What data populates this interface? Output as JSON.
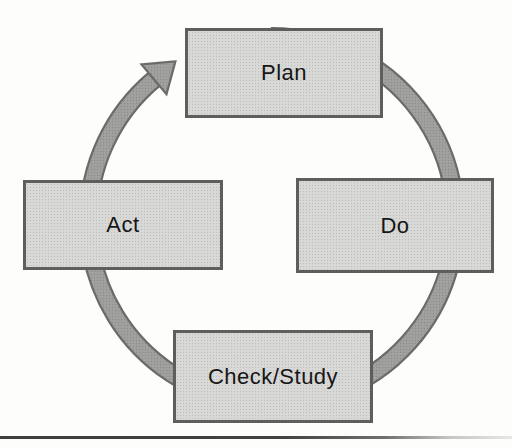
{
  "diagram": {
    "type": "cycle",
    "direction": "clockwise",
    "nodes": [
      {
        "id": "plan",
        "label": "Plan",
        "position": "top"
      },
      {
        "id": "do",
        "label": "Do",
        "position": "right"
      },
      {
        "id": "check_study",
        "label": "Check/Study",
        "position": "bottom"
      },
      {
        "id": "act",
        "label": "Act",
        "position": "left"
      }
    ],
    "arrow": {
      "from": "act",
      "to": "plan"
    },
    "colors": {
      "ring_fill": "#9c9c9a",
      "ring_outline": "#6b6b69",
      "node_fill": "#d8d8d6",
      "node_border": "#5e5e5c",
      "label_text": "#161616",
      "background": "#fdfdfc",
      "bottom_rule": "#3e3e3c"
    }
  }
}
